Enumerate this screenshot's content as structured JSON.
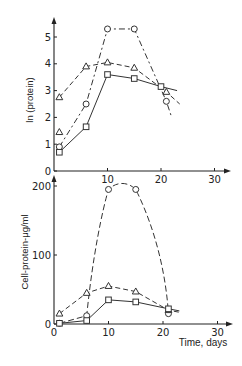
{
  "chart_data": [
    {
      "type": "line",
      "panel": "top",
      "title": "",
      "xlabel": "",
      "ylabel": "ln (protein)",
      "xlim": [
        0,
        30
      ],
      "ylim": [
        0,
        5.5
      ],
      "x_ticks": [
        "10",
        "20",
        "30"
      ],
      "y_ticks": [
        "0",
        "1",
        "2",
        "3",
        "4",
        "5"
      ],
      "grid": false,
      "legend": "none",
      "series": [
        {
          "name": "circles",
          "marker": "circle",
          "dash": "6,3,2,3",
          "x": [
            1,
            6,
            10,
            15,
            21
          ],
          "values": [
            0.9,
            2.5,
            5.3,
            5.3,
            2.6
          ],
          "line_extend": [
            22,
            2.0
          ]
        },
        {
          "name": "triangles",
          "marker": "triangle",
          "dash": "5,3",
          "x": [
            1,
            6,
            10,
            15,
            21
          ],
          "values": [
            2.75,
            3.9,
            4.05,
            3.85,
            2.95
          ],
          "line_extend": [
            23.5,
            2.5
          ]
        },
        {
          "name": "squares",
          "marker": "square",
          "dash": "",
          "x": [
            1,
            6,
            10,
            15,
            20
          ],
          "values": [
            0.7,
            1.65,
            3.6,
            3.45,
            3.15
          ],
          "line_extend": [
            23,
            3.0
          ]
        },
        {
          "name": "extra-triangle",
          "marker": "triangle",
          "dash": "none",
          "x": [
            1
          ],
          "values": [
            1.45
          ]
        }
      ]
    },
    {
      "type": "line",
      "panel": "bottom",
      "title": "",
      "xlabel": "Time, days",
      "ylabel": "Cell-protein-μg/ml",
      "xlim": [
        0,
        30
      ],
      "ylim": [
        0,
        210
      ],
      "x_ticks": [
        "0",
        "10",
        "20",
        "30"
      ],
      "y_ticks": [
        "0",
        "100",
        "200"
      ],
      "grid": false,
      "legend": "none",
      "series": [
        {
          "name": "circles",
          "marker": "circle",
          "dash": "6,3",
          "x": [
            1,
            6,
            10,
            15,
            21
          ],
          "values": [
            1,
            12,
            195,
            195,
            15
          ]
        },
        {
          "name": "triangles",
          "marker": "triangle",
          "dash": "5,3",
          "x": [
            1,
            6,
            10,
            15,
            21
          ],
          "values": [
            15,
            45,
            55,
            47,
            20
          ],
          "line_extend": [
            23,
            17
          ]
        },
        {
          "name": "squares",
          "marker": "square",
          "dash": "",
          "x": [
            1,
            6,
            10,
            15,
            21
          ],
          "values": [
            1,
            5,
            35,
            32,
            22
          ],
          "line_extend": [
            23,
            19
          ]
        }
      ]
    }
  ]
}
